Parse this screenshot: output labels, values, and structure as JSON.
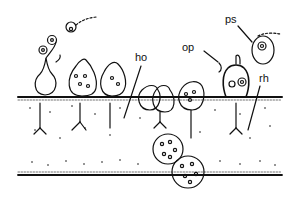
{
  "diagram": {
    "type": "biological line drawing",
    "labels": [
      {
        "id": "ho",
        "text": "ho"
      },
      {
        "id": "op",
        "text": "op"
      },
      {
        "id": "ps",
        "text": "ps"
      },
      {
        "id": "rh",
        "text": "rh"
      }
    ],
    "colors": {
      "ink": "#111111",
      "background": "#ffffff"
    }
  }
}
